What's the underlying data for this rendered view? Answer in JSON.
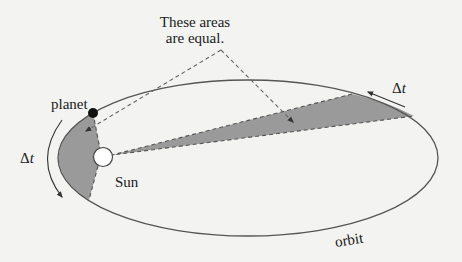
{
  "diagram": {
    "callout": {
      "line1": "These areas",
      "line2": "are equal."
    },
    "labels": {
      "planet": "planet",
      "sun": "Sun",
      "orbit": "orbit",
      "delta_t_left_symbol": "Δ",
      "delta_t_left_var": "t",
      "delta_t_right_symbol": "Δ",
      "delta_t_right_var": "t"
    },
    "colors": {
      "background": "#f3f3f1",
      "orbit_stroke": "#555555",
      "shaded_area": "#9a9a9a",
      "dashed_line": "#666666",
      "planet": "#111111",
      "sun_fill": "#ffffff",
      "sun_stroke": "#444444",
      "text": "#1a1a1a"
    },
    "geometry": {
      "orbit": {
        "cx": 248,
        "cy": 158,
        "rx": 190,
        "ry": 78
      },
      "sun": {
        "cx": 103,
        "cy": 157,
        "r": 9
      },
      "planet": {
        "cx": 93,
        "cy": 113,
        "r": 5
      }
    }
  }
}
